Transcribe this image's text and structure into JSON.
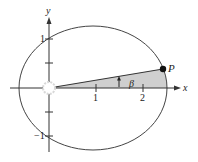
{
  "diagram": {
    "type": "ellipse-orbit-sector",
    "colors": {
      "stroke": "#444444",
      "axis": "#333333",
      "shade": "#cfcfcf",
      "point": "#111111",
      "focus_fill": "#ffffff"
    },
    "axes": {
      "x_label": "x",
      "y_label": "y",
      "x_ticks": [
        {
          "value": 1,
          "label": "1"
        },
        {
          "value": 2,
          "label": "2"
        }
      ],
      "y_ticks": [
        {
          "value": 1,
          "label": "1"
        },
        {
          "value": -1,
          "label": "−1"
        }
      ]
    },
    "point": {
      "label": "P"
    },
    "angle": {
      "label": "β"
    },
    "focus": {
      "label": ""
    }
  }
}
